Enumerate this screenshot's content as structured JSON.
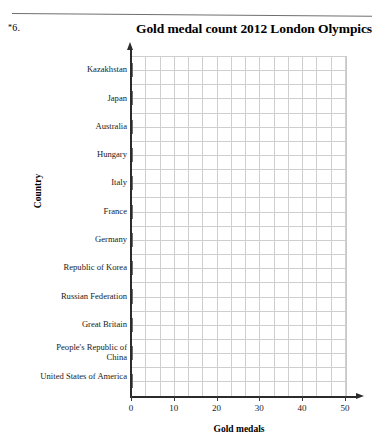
{
  "problem": {
    "star": "*",
    "number": "6."
  },
  "chart_data": {
    "type": "bar",
    "orientation": "horizontal",
    "title": "Gold medal count 2012 London Olympics",
    "xlabel": "Gold medals",
    "ylabel": "Country",
    "xlim": [
      0,
      50
    ],
    "xticks": [
      "0",
      "10",
      "20",
      "30",
      "40",
      "50"
    ],
    "grid": true,
    "legend": null,
    "bar_color": "#b2b2b2",
    "bar_border_color": "#6e6e6e",
    "categories": [
      "Kazakhstan",
      "Japan",
      "Australia",
      "Hungary",
      "Italy",
      "France",
      "Germany",
      "Republic of Korea",
      "Russian Federation",
      "Great Britain",
      "People's Republic of China",
      "United States of America"
    ],
    "values": [
      7,
      7,
      7,
      8,
      8,
      11,
      11,
      13,
      24,
      29,
      38,
      46
    ]
  }
}
